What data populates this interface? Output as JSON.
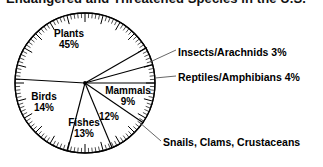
{
  "title": "Endangered and Threatened Species in the U.S.",
  "chart_data": {
    "type": "pie",
    "title": "Endangered and Threatened Species in the U.S.",
    "xlabel": "",
    "ylabel": "",
    "legend_position": "none",
    "grid": false,
    "units": "percent",
    "categories": [
      "Plants",
      "Insects/Arachnids",
      "Reptiles/Amphibians",
      "Mammals",
      "Snails, Clams, Crustaceans",
      "Fishes",
      "Birds"
    ],
    "values": [
      45,
      3,
      4,
      9,
      12,
      13,
      14
    ],
    "slices": [
      {
        "name": "Plants",
        "value": 45,
        "label": "Plants",
        "percent": "45%",
        "label_placement": "inside"
      },
      {
        "name": "Insects/Arachnids",
        "value": 3,
        "label": "Insects/Arachnids",
        "percent": "3%",
        "label_placement": "callout"
      },
      {
        "name": "Reptiles/Amphibians",
        "value": 4,
        "label": "Reptiles/Amphibians",
        "percent": "4%",
        "label_placement": "callout"
      },
      {
        "name": "Mammals",
        "value": 9,
        "label": "Mammals",
        "percent": "9%",
        "label_placement": "inside"
      },
      {
        "name": "Snails, Clams, Crustaceans",
        "value": 12,
        "label": "Snails, Clams, Crustaceans",
        "percent": "12%",
        "label_placement": "callout-split"
      },
      {
        "name": "Fishes",
        "value": 13,
        "label": "Fishes",
        "percent": "13%",
        "label_placement": "inside"
      },
      {
        "name": "Birds",
        "value": 14,
        "label": "Birds",
        "percent": "14%",
        "label_placement": "inside"
      }
    ],
    "total": 100,
    "colors": {
      "slice_fill": "#ffffff",
      "outline": "#000000",
      "background": "#ffffff",
      "text": "#000000"
    }
  },
  "labels": {
    "plants": {
      "name": "Plants",
      "percent": "45%"
    },
    "birds": {
      "name": "Birds",
      "percent": "14%"
    },
    "fishes": {
      "name": "Fishes",
      "percent": "13%"
    },
    "mammals": {
      "name": "Mammals",
      "percent": "9%"
    },
    "snails_percent": "12%",
    "insects": "Insects/Arachnids 3%",
    "reptiles": "Reptiles/Amphibians 4%",
    "snails": "Snails, Clams, Crustaceans"
  }
}
